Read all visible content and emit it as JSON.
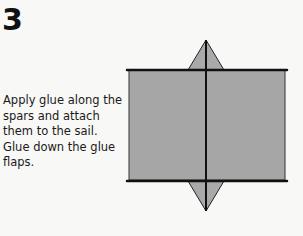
{
  "step": {
    "number": "3",
    "instructions": "Apply glue along the spars and attach them to the sail. Glue down the glue flaps."
  },
  "diagram": {
    "sail_color": "#a6a6a6",
    "flap_color": "#a9a9a9",
    "spar_color": "#111111"
  }
}
